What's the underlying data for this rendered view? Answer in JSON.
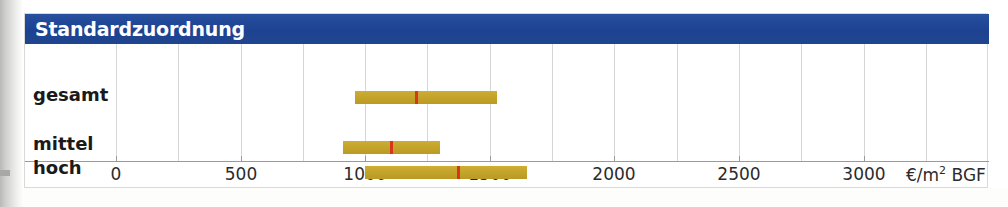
{
  "figure": {
    "title": "Standardzuordnung",
    "title_bar_color": "#1f4695"
  },
  "chart_data": {
    "type": "bar",
    "subtype": "range-bar-with-marker",
    "title": "Standardzuordnung",
    "xlabel": "€/m² BGF",
    "ylabel": "",
    "xlim": [
      0,
      3400
    ],
    "xticks": [
      0,
      500,
      1000,
      1500,
      2000,
      2500,
      3000
    ],
    "xticklabels": [
      "0",
      "500",
      "1000",
      "1500",
      "2000",
      "2500",
      "3000"
    ],
    "gridlines": [
      0,
      250,
      500,
      750,
      1000,
      1250,
      1500,
      1750,
      2000,
      2250,
      2500,
      2750,
      3000,
      3250
    ],
    "grid": true,
    "legend": "none",
    "bar_color": "#c2a12a",
    "marker_color": "#d8351b",
    "categories": [
      "gesamt",
      "mittel",
      "hoch"
    ],
    "series": [
      {
        "name": "gesamt",
        "low": 960,
        "high": 1530,
        "marker": 1200
      },
      {
        "name": "mittel",
        "low": 910,
        "high": 1300,
        "marker": 1100
      },
      {
        "name": "hoch",
        "low": 1000,
        "high": 1650,
        "marker": 1370
      }
    ]
  },
  "axis": {
    "unit_prefix": "€/m",
    "unit_exponent": "2",
    "unit_suffix": " BGF"
  },
  "rows": [
    {
      "label": "gesamt"
    },
    {
      "label": "mittel"
    },
    {
      "label": "hoch"
    }
  ]
}
